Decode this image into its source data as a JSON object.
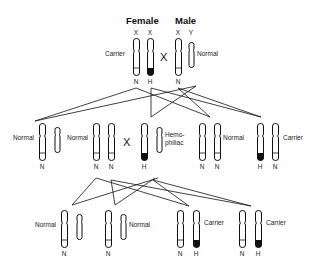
{
  "headers": {
    "female": "Female",
    "male": "Male"
  },
  "cross_symbol": "X",
  "generation_1": {
    "female": {
      "label": "Carrier",
      "chromosomes": [
        "X",
        "X"
      ],
      "alleles": [
        "N",
        "H"
      ]
    },
    "male": {
      "label": "Normal",
      "chromosomes": [
        "X",
        "Y"
      ],
      "alleles": [
        "N"
      ]
    }
  },
  "generation_2": [
    {
      "label": "Normal",
      "sex": "male",
      "alleles": [
        "N"
      ]
    },
    {
      "label": "Normal",
      "sex": "female",
      "alleles": [
        "N",
        "N"
      ]
    },
    {
      "label": "Hemo-\nphiliac",
      "label_lines": [
        "Hemo-",
        "philiac"
      ],
      "sex": "male",
      "alleles": [
        "H"
      ]
    },
    {
      "label": "Normal",
      "sex": "female",
      "alleles": [
        "N",
        "N"
      ]
    },
    {
      "label": "Carrier",
      "sex": "female",
      "alleles": [
        "H",
        "N"
      ]
    }
  ],
  "generation_3": [
    {
      "label": "Normal",
      "sex": "male",
      "alleles": [
        "N"
      ]
    },
    {
      "label": "Normal",
      "sex": "male",
      "alleles": [
        "N"
      ]
    },
    {
      "label": "Carrier",
      "sex": "female",
      "alleles": [
        "N",
        "H"
      ]
    },
    {
      "label": "Carrier",
      "sex": "female",
      "alleles": [
        "N",
        "H"
      ]
    }
  ],
  "colors": {
    "outline": "#111111",
    "hemophilia_band": "#111111",
    "background": "#ffffff"
  }
}
